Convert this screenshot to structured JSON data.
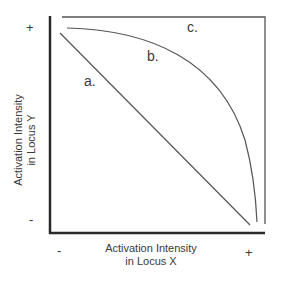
{
  "diagram": {
    "title": "",
    "x_axis": {
      "label_line1": "Activation Intensity",
      "label_line2": "in Locus X",
      "min_label": "-",
      "max_label": "+"
    },
    "y_axis": {
      "label_line1": "Activation Intensity",
      "label_line2": "in Locus Y",
      "min_label": "-",
      "max_label": "+"
    },
    "curves": [
      {
        "id": "a",
        "label": "a.",
        "shape": "straight diagonal line from high Y / low X to low Y / high X"
      },
      {
        "id": "b",
        "label": "b.",
        "shape": "concave (bowed outward) curve from high Y to high X"
      },
      {
        "id": "c",
        "label": "c.",
        "shape": "right-angle boundary: flat at max Y, then drops vertically at max X"
      }
    ],
    "colors": {
      "axis": "#2a2a2a",
      "curve": "#555555",
      "text": "#3a3a3a",
      "background": "#ffffff"
    }
  }
}
